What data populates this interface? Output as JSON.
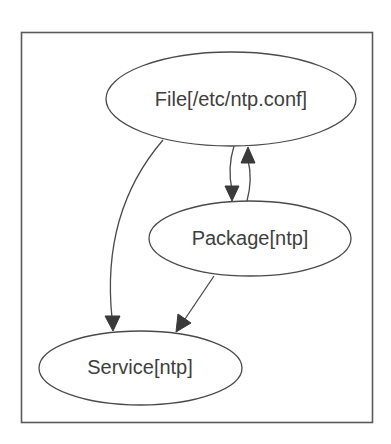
{
  "diagram": {
    "type": "directed-graph",
    "style": {
      "line_color": "#4a4a4a",
      "text_color": "#3e3e3e",
      "arrow_color": "#3a3a3a",
      "frame_color": "#5a5a5a",
      "background": "#ffffff"
    },
    "nodes": [
      {
        "id": "file",
        "label": "File[/etc/ntp.conf]",
        "shape": "ellipse"
      },
      {
        "id": "package",
        "label": "Package[ntp]",
        "shape": "ellipse"
      },
      {
        "id": "service",
        "label": "Service[ntp]",
        "shape": "ellipse"
      }
    ],
    "edges": [
      {
        "from": "file",
        "to": "package"
      },
      {
        "from": "package",
        "to": "file"
      },
      {
        "from": "file",
        "to": "service"
      },
      {
        "from": "package",
        "to": "service"
      }
    ]
  }
}
